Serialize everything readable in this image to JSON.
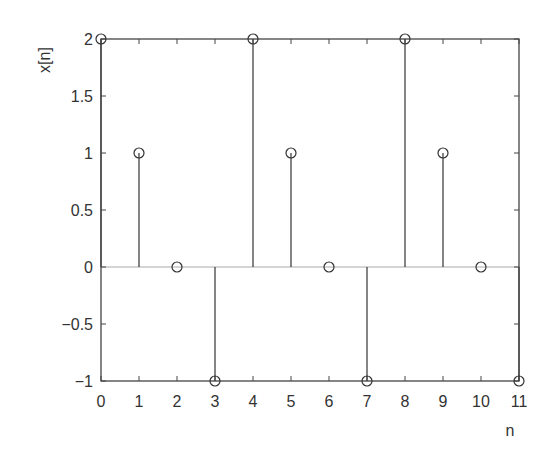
{
  "chart_data": {
    "type": "stem",
    "title": "",
    "xlabel": "n",
    "ylabel": "x[n]",
    "x": [
      0,
      1,
      2,
      3,
      4,
      5,
      6,
      7,
      8,
      9,
      10,
      11
    ],
    "values": [
      2,
      1,
      0,
      -1,
      2,
      1,
      0,
      -1,
      2,
      1,
      0,
      -1
    ],
    "xlim": [
      0,
      11
    ],
    "ylim": [
      -1,
      2
    ],
    "xticks": [
      "0",
      "1",
      "2",
      "3",
      "4",
      "5",
      "6",
      "7",
      "8",
      "9",
      "10",
      "11"
    ],
    "yticks": [
      {
        "value": 2,
        "label": "2"
      },
      {
        "value": 1.5,
        "label": "1.5"
      },
      {
        "value": 1,
        "label": "1"
      },
      {
        "value": 0.5,
        "label": "0.5"
      },
      {
        "value": 0,
        "label": "0"
      },
      {
        "value": -0.5,
        "label": "−0.5"
      },
      {
        "value": -1,
        "label": "−1"
      }
    ],
    "grid": false,
    "marker": "open-circle",
    "baseline": 0,
    "colors": {
      "stem": "#333333",
      "axis": "#444444",
      "baseline": "#aaaaaa"
    }
  }
}
